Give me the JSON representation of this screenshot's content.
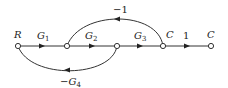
{
  "diagram": {
    "type": "signal-flow-graph",
    "nodes": [
      {
        "id": "R",
        "label": "R",
        "x": 18,
        "y": 46
      },
      {
        "id": "n2",
        "label": "",
        "x": 67,
        "y": 46
      },
      {
        "id": "n3",
        "label": "",
        "x": 117,
        "y": 46
      },
      {
        "id": "C1",
        "label": "C",
        "x": 163,
        "y": 46
      },
      {
        "id": "C2",
        "label": "C",
        "x": 211,
        "y": 46
      }
    ],
    "branches": [
      {
        "from": "R",
        "to": "n2",
        "gain": "G",
        "gain_sub": "1"
      },
      {
        "from": "n2",
        "to": "n3",
        "gain": "G",
        "gain_sub": "2"
      },
      {
        "from": "n3",
        "to": "C1",
        "gain": "G",
        "gain_sub": "3"
      },
      {
        "from": "C1",
        "to": "C2",
        "gain": "1",
        "gain_sub": ""
      },
      {
        "from": "C1",
        "to": "n2",
        "gain": "−1",
        "gain_sub": "",
        "kind": "feedback-top"
      },
      {
        "from": "n3",
        "to": "R",
        "gain": "−G",
        "gain_sub": "4",
        "kind": "feedback-bottom"
      }
    ],
    "labels": {
      "R": "R",
      "C_mid": "C",
      "C_out": "C",
      "g1": "G",
      "g1_sub": "1",
      "g2": "G",
      "g2_sub": "2",
      "g3": "G",
      "g3_sub": "3",
      "unity": "1",
      "top_fb": "−1",
      "bottom_fb": "−G",
      "bottom_fb_sub": "4"
    }
  }
}
